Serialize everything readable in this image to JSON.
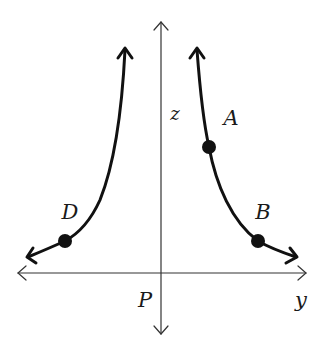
{
  "diagram": {
    "type": "reciprocal-curve-on-axes",
    "colors": {
      "background": "#ffffff",
      "axis": "#333333",
      "curve": "#111111",
      "point": "#111111",
      "label": "#1a1a1a"
    },
    "axes": {
      "horizontal_label": "y",
      "vertical_label": "z",
      "origin_label": "P"
    },
    "points": [
      {
        "id": "A",
        "label": "A",
        "branch": "right"
      },
      {
        "id": "B",
        "label": "B",
        "branch": "right"
      },
      {
        "id": "D",
        "label": "D",
        "branch": "left"
      }
    ]
  }
}
